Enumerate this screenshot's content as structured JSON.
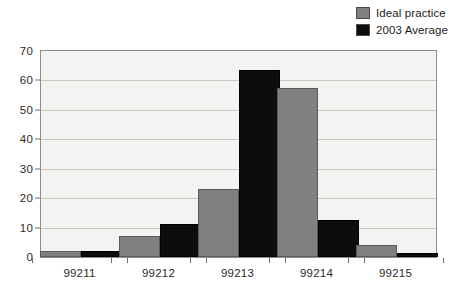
{
  "chart_data": {
    "type": "bar",
    "title": "",
    "subtitle": "",
    "xlabel": "",
    "ylabel": "",
    "categories": [
      "99211",
      "99212",
      "99213",
      "99214",
      "99215"
    ],
    "series": [
      {
        "name": "Ideal practice",
        "color": "#808080",
        "values": [
          2,
          7,
          23,
          57.5,
          4
        ]
      },
      {
        "name": "2003 Average",
        "color": "#000000",
        "values": [
          2.2,
          11.3,
          63.5,
          12.5,
          1.3
        ]
      }
    ],
    "ylim": [
      0,
      70
    ],
    "y_ticks": [
      0,
      10,
      20,
      30,
      40,
      50,
      60,
      70
    ],
    "y_tick_labels": [
      "0",
      "10",
      "20",
      "30",
      "40",
      "50",
      "60",
      "70"
    ],
    "grid": true,
    "grid_axis": "y",
    "legend": {
      "position": "top-right",
      "entries": [
        {
          "label": "Ideal practice",
          "swatch": "#808080"
        },
        {
          "label": "2003 Average",
          "swatch": "#0d0d0d"
        }
      ]
    },
    "plot_background": "#f3f3f1",
    "axis_color": "#8d8d8d"
  }
}
